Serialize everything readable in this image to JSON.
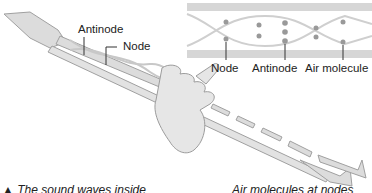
{
  "figure": {
    "main_labels": {
      "antinode": "Antinode",
      "node": "Node"
    },
    "inset": {
      "labels": {
        "node": "Node",
        "antinode": "Antinode",
        "air_molecule": "Air molecule"
      }
    },
    "captions": {
      "left": "▲ The sound waves inside",
      "right": "Air molecules at nodes"
    },
    "colors": {
      "pipe_fill": "#d9d9d9",
      "pipe_stroke": "#9a9a9a",
      "wave": "#c8c8c8",
      "molecule": "#8f8f8f",
      "text": "#222222"
    }
  }
}
